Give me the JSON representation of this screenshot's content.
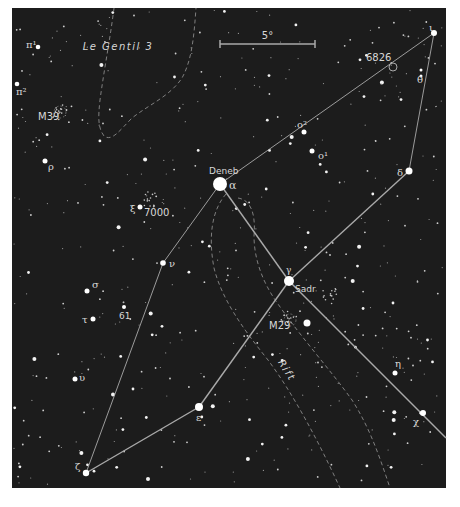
{
  "map": {
    "title": "Cygnus star chart",
    "background_color": "#1c1c1c",
    "frame": {
      "x": 12,
      "y": 8,
      "width": 434,
      "height": 480
    },
    "line_color": "#a9a9a9",
    "dashed_color": "#8a8a8a",
    "label_color": "#d8d8d8",
    "scale_bar": {
      "label": "5°",
      "x1": 220,
      "x2": 315,
      "y": 44
    },
    "region_labels": [
      {
        "id": "le-gentil-3",
        "text": "Le Gentil 3",
        "x": 118,
        "y": 50,
        "rotate": 0
      },
      {
        "id": "rift",
        "text": "Rift",
        "x": 284,
        "y": 372,
        "rotate": 58
      }
    ],
    "named_stars": [
      {
        "id": "deneb",
        "greek": "α",
        "name": "Deneb",
        "x": 220,
        "y": 184,
        "r": 7
      },
      {
        "id": "sadr",
        "greek": "γ",
        "name": "Sadr",
        "x": 289,
        "y": 281,
        "r": 5
      },
      {
        "id": "delta",
        "greek": "δ",
        "x": 409,
        "y": 171,
        "r": 3.5
      },
      {
        "id": "iota",
        "greek": "ι",
        "x": 434,
        "y": 33,
        "r": 3
      },
      {
        "id": "theta",
        "greek": "θ",
        "x": 421,
        "y": 76,
        "r": 1.5
      },
      {
        "id": "epsilon",
        "greek": "ε",
        "x": 199,
        "y": 407,
        "r": 4
      },
      {
        "id": "zeta",
        "greek": "ζ",
        "x": 86,
        "y": 473,
        "r": 3.2
      },
      {
        "id": "nu",
        "greek": "ν",
        "x": 163,
        "y": 263,
        "r": 2.8
      },
      {
        "id": "xi",
        "greek": "ξ",
        "x": 140,
        "y": 207,
        "r": 2.5
      },
      {
        "id": "sigma",
        "greek": "σ",
        "x": 87,
        "y": 291,
        "r": 2.5
      },
      {
        "id": "tau",
        "greek": "τ",
        "x": 93,
        "y": 319,
        "r": 2.5
      },
      {
        "id": "upsilon",
        "greek": "υ",
        "x": 75,
        "y": 379,
        "r": 2.5
      },
      {
        "id": "eta",
        "greek": "η",
        "x": 395,
        "y": 373,
        "r": 2.5
      },
      {
        "id": "chi",
        "greek": "χ",
        "x": 423,
        "y": 413,
        "r": 3
      },
      {
        "id": "omicron2",
        "greek": "o²",
        "x": 304,
        "y": 132,
        "r": 2.5
      },
      {
        "id": "omicron1",
        "greek": "o¹",
        "x": 312,
        "y": 151,
        "r": 2.5
      },
      {
        "id": "pi1",
        "greek": "π¹",
        "x": 38,
        "y": 47,
        "r": 2.3
      },
      {
        "id": "pi2",
        "greek": "π²",
        "x": 17,
        "y": 84,
        "r": 2.3
      },
      {
        "id": "rho",
        "greek": "ρ",
        "x": 45,
        "y": 161,
        "r": 2.5
      },
      {
        "id": "61-cyg",
        "name": "61",
        "x": 124,
        "y": 307,
        "r": 2
      }
    ],
    "star_labels": [
      {
        "for": "deneb",
        "text": "Deneb",
        "x": 209,
        "y": 174,
        "size": 9
      },
      {
        "for": "deneb",
        "text": "α",
        "x": 229,
        "y": 189,
        "size": 11
      },
      {
        "for": "sadr",
        "text": "γ",
        "x": 286,
        "y": 273,
        "size": 9
      },
      {
        "for": "sadr",
        "text": "Sadr",
        "x": 295,
        "y": 292,
        "size": 9
      },
      {
        "for": "delta",
        "text": "δ",
        "x": 397,
        "y": 176,
        "size": 10
      },
      {
        "for": "iota",
        "text": "ι",
        "x": 429,
        "y": 31,
        "size": 10
      },
      {
        "for": "theta",
        "text": "θ",
        "x": 417,
        "y": 83,
        "size": 10
      },
      {
        "for": "epsilon",
        "text": "ε",
        "x": 196,
        "y": 421,
        "size": 10
      },
      {
        "for": "zeta",
        "text": "ζ",
        "x": 75,
        "y": 470,
        "size": 10
      },
      {
        "for": "nu",
        "text": "ν",
        "x": 169,
        "y": 267,
        "size": 10
      },
      {
        "for": "xi",
        "text": "ξ",
        "x": 130,
        "y": 212,
        "size": 10
      },
      {
        "for": "sigma",
        "text": "σ",
        "x": 92,
        "y": 288,
        "size": 10
      },
      {
        "for": "tau",
        "text": "τ",
        "x": 82,
        "y": 323,
        "size": 10
      },
      {
        "for": "upsilon",
        "text": "υ",
        "x": 79,
        "y": 381,
        "size": 10
      },
      {
        "for": "eta",
        "text": "η",
        "x": 395,
        "y": 367,
        "size": 10
      },
      {
        "for": "chi",
        "text": "χ",
        "x": 413,
        "y": 425,
        "size": 10
      },
      {
        "for": "omicron2",
        "text": "o²",
        "x": 297,
        "y": 128,
        "size": 10
      },
      {
        "for": "omicron1",
        "text": "o¹",
        "x": 318,
        "y": 159,
        "size": 10
      },
      {
        "for": "pi1",
        "text": "π¹",
        "x": 26,
        "y": 48,
        "size": 10
      },
      {
        "for": "pi2",
        "text": "π²",
        "x": 16,
        "y": 95,
        "size": 10
      },
      {
        "for": "rho",
        "text": "ρ",
        "x": 48,
        "y": 170,
        "size": 10
      },
      {
        "for": "61-cyg",
        "text": "61",
        "x": 119,
        "y": 319,
        "size": 9
      }
    ],
    "deep_sky_objects": [
      {
        "id": "ngc6826",
        "label": "6826",
        "x": 393,
        "y": 67,
        "label_x": 366,
        "label_y": 61,
        "marker": "circle"
      },
      {
        "id": "ngc7000",
        "label": "7000",
        "x": 150,
        "y": 212,
        "label_x": 144,
        "label_y": 216,
        "marker": "none"
      },
      {
        "id": "m39",
        "label": "M39",
        "x": 60,
        "y": 112,
        "label_x": 38,
        "label_y": 120,
        "marker": "cluster"
      },
      {
        "id": "m29",
        "label": "M29",
        "x": 290,
        "y": 320,
        "label_x": 269,
        "label_y": 329,
        "marker": "cluster"
      }
    ],
    "constellation_lines": [
      {
        "from": "deneb",
        "to": "sadr"
      },
      {
        "from": "sadr",
        "to": "epsilon"
      },
      {
        "from": "epsilon",
        "to": "zeta"
      },
      {
        "from": "deneb",
        "to": "nu"
      },
      {
        "from": "nu",
        "to": "zeta"
      },
      {
        "from": "delta",
        "to": "sadr"
      },
      {
        "from": "sadr",
        "to": "chi_edge"
      },
      {
        "from": "deneb",
        "to": "iota"
      },
      {
        "from": "iota",
        "to": "delta"
      }
    ],
    "extra_points": {
      "chi_edge": {
        "x": 446,
        "y": 438
      }
    }
  }
}
